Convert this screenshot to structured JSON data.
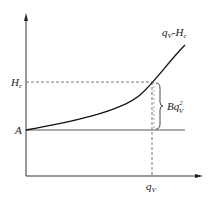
{
  "diagram": {
    "curve_label": {
      "main": "q",
      "sub1": "V",
      "mid": "-H",
      "sub2": "c"
    },
    "y_label_hc": {
      "main": "H",
      "sub": "c"
    },
    "y_label_a": "A",
    "x_label_qv": {
      "main": "q",
      "sub": "V"
    },
    "bracket_label": {
      "main": "Bq",
      "sup": "2",
      "sub": "V"
    },
    "line_color": "#222222",
    "dash_color": "#555555"
  }
}
